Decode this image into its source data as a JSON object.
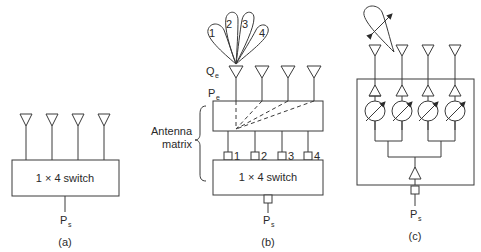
{
  "panels": {
    "a": {
      "caption": "(a)",
      "switch_label": "1 × 4 switch",
      "input_label": "P",
      "input_sub": "s",
      "antenna_count": 4
    },
    "b": {
      "caption": "(b)",
      "switch_label": "1 × 4 switch",
      "input_label": "P",
      "input_sub": "s",
      "element_label": "Q",
      "element_sub": "e",
      "port_label": "P",
      "port_sub": "e",
      "matrix_label_line1": "Antenna",
      "matrix_label_line2": "matrix",
      "beam_labels": [
        "1",
        "2",
        "3",
        "4"
      ],
      "port_numbers": [
        "1",
        "2",
        "3",
        "4"
      ],
      "antenna_count": 4
    },
    "c": {
      "caption": "(c)",
      "input_label": "P",
      "input_sub": "s",
      "antenna_count": 4,
      "phase_shifter_count": 4,
      "amplifier_count": 5
    }
  }
}
